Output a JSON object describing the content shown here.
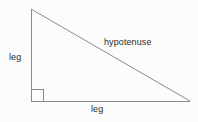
{
  "diagram": {
    "type": "right-triangle",
    "background_color": "#fcfcfc",
    "stroke_color": "#8a8a8a",
    "text_color": "#2b2b2b",
    "stroke_width": 1,
    "vertices": {
      "apex": {
        "x": 31,
        "y": 9
      },
      "right_angle": {
        "x": 31,
        "y": 101
      },
      "base_right": {
        "x": 190,
        "y": 101
      }
    },
    "right_angle_marker": {
      "name": "right-angle-square",
      "x": 31,
      "y": 89,
      "size": 12
    },
    "labels": {
      "leg_vertical": "leg",
      "hypotenuse": "hypotenuse",
      "leg_horizontal": "leg"
    }
  }
}
